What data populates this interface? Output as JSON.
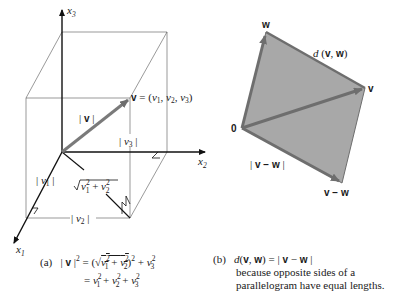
{
  "figure_a": {
    "axes": {
      "x1": {
        "name": "x",
        "sub": "1"
      },
      "x2": {
        "name": "x",
        "sub": "2"
      },
      "x3": {
        "name": "x",
        "sub": "3"
      }
    },
    "labels": {
      "v_point": "v = (v1, v2, v3)",
      "norm_v": "| v |",
      "abs_v1": "| v1 |",
      "abs_v2": "| v2 |",
      "abs_v3": "| v3 |",
      "sqrt_v1v2": "√(v1² + v2²)"
    },
    "caption": {
      "tag": "(a)",
      "line1": "| v |² = (√(v1² + v2²))² + v3²",
      "line2": "= v1² + v2² + v3²"
    }
  },
  "figure_b": {
    "labels": {
      "origin": "0",
      "w": "w",
      "v": "v",
      "v_minus_w": "v − w",
      "distance": "d(v, w)",
      "norm_v_minus_w": "| v − w |"
    },
    "caption": {
      "tag": "(b)",
      "line1": "d(v, w) = | v − w |",
      "line2": "because opposite sides of a",
      "line3": "parallelogram have equal lengths."
    },
    "colors": {
      "fill": "#a8a8a8",
      "vector": "#6e6e6e"
    }
  }
}
